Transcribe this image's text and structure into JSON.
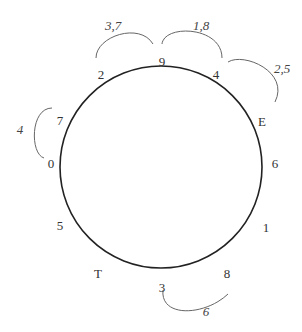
{
  "diagram": {
    "circle": {
      "cx": 161,
      "cy": 167,
      "r": 101,
      "stroke": "#222"
    },
    "nodes": [
      {
        "label": "9",
        "x": 162,
        "y": 61
      },
      {
        "label": "2",
        "x": 101,
        "y": 74
      },
      {
        "label": "4",
        "x": 216,
        "y": 74
      },
      {
        "label": "E",
        "x": 262,
        "y": 121
      },
      {
        "label": "7",
        "x": 60,
        "y": 120
      },
      {
        "label": "0",
        "x": 51,
        "y": 163
      },
      {
        "label": "6",
        "x": 275,
        "y": 163
      },
      {
        "label": "5",
        "x": 60,
        "y": 225
      },
      {
        "label": "1",
        "x": 266,
        "y": 227
      },
      {
        "label": "T",
        "x": 98,
        "y": 273
      },
      {
        "label": "8",
        "x": 227,
        "y": 273
      },
      {
        "label": "3",
        "x": 162,
        "y": 287
      }
    ],
    "arcs": [
      {
        "label": "3,7",
        "lx": 113,
        "ly": 30,
        "path": "M96,58 C96,36 140,22 153,44"
      },
      {
        "label": "1,8",
        "lx": 201,
        "ly": 30,
        "path": "M162,44 C164,24 222,26 222,58"
      },
      {
        "label": "2,5",
        "lx": 282,
        "ly": 73,
        "path": "M228,62 C244,52 290,72 275,102"
      },
      {
        "label": "4",
        "lx": 20,
        "ly": 134,
        "path": "M52,108 C30,108 30,154 44,158"
      },
      {
        "label": "6",
        "lx": 206,
        "ly": 316,
        "path": "M163,290 C160,318 205,316 228,294"
      }
    ]
  }
}
